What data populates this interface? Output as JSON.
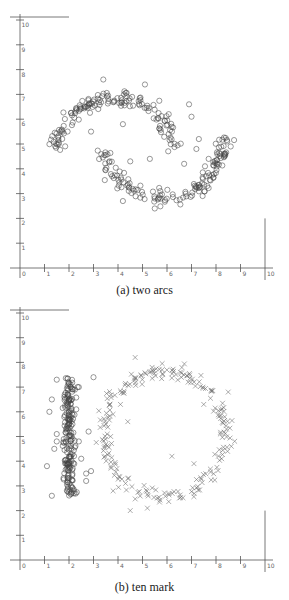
{
  "chart_data": [
    {
      "type": "scatter",
      "title": "",
      "caption": "(a) two arcs",
      "xlabel": "",
      "ylabel": "",
      "xlim": [
        0,
        10
      ],
      "ylim": [
        0,
        10
      ],
      "xticks": [
        "0",
        "1",
        "2",
        "3",
        "4",
        "5",
        "6",
        "7",
        "8",
        "9",
        "10"
      ],
      "yticks": [
        "1",
        "2",
        "3",
        "4",
        "5",
        "6",
        "7",
        "8",
        "9",
        "10"
      ],
      "grid": false,
      "legend": null,
      "series": [
        {
          "name": "upper arc",
          "marker": "circle",
          "shape": "arc",
          "center": [
            3.9,
            4.4
          ],
          "radius": 2.5,
          "angle_range_deg": [
            10,
            170
          ],
          "noise": 0.22,
          "count": 150
        },
        {
          "name": "lower arc",
          "marker": "circle",
          "shape": "arc",
          "center": [
            5.8,
            5.3
          ],
          "radius": 2.5,
          "angle_range_deg": [
            190,
            360
          ],
          "noise": 0.22,
          "count": 150
        },
        {
          "name": "outliers",
          "marker": "circle",
          "points": [
            [
              3.4,
              7.6
            ],
            [
              5.1,
              7.4
            ],
            [
              6.9,
              6.6
            ],
            [
              4.2,
              5.8
            ],
            [
              2.9,
              5.5
            ],
            [
              6.2,
              5.5
            ],
            [
              7.0,
              6.1
            ],
            [
              7.3,
              5.2
            ],
            [
              7.2,
              4.8
            ],
            [
              8.6,
              4.9
            ],
            [
              5.3,
              4.4
            ],
            [
              4.5,
              4.3
            ],
            [
              4.2,
              2.7
            ],
            [
              5.5,
              2.4
            ],
            [
              7.6,
              3.7
            ],
            [
              7.7,
              4.4
            ],
            [
              6.7,
              4.2
            ]
          ]
        }
      ]
    },
    {
      "type": "scatter",
      "title": "",
      "caption": "(b) ten mark",
      "xlabel": "",
      "ylabel": "",
      "xlim": [
        0,
        10
      ],
      "ylim": [
        0,
        10
      ],
      "xticks": [
        "0",
        "1",
        "2",
        "3",
        "4",
        "5",
        "6",
        "7",
        "8",
        "9",
        "10"
      ],
      "yticks": [
        "1",
        "2",
        "3",
        "4",
        "5",
        "6",
        "7",
        "8",
        "9",
        "10"
      ],
      "grid": false,
      "legend": null,
      "series": [
        {
          "name": "vertical bar (1)",
          "marker": "circle",
          "shape": "bar",
          "x_center": 2.0,
          "x_spread": 0.18,
          "y_range": [
            2.6,
            7.4
          ],
          "count": 200,
          "outliers": [
            [
              1.5,
              7.3
            ],
            [
              1.3,
              6.5
            ],
            [
              1.2,
              6.0
            ],
            [
              1.5,
              4.8
            ],
            [
              1.4,
              4.5
            ],
            [
              2.4,
              7.0
            ],
            [
              3.0,
              7.4
            ],
            [
              2.8,
              5.2
            ],
            [
              2.4,
              4.8
            ],
            [
              2.5,
              4.1
            ],
            [
              1.1,
              3.8
            ],
            [
              1.3,
              2.6
            ],
            [
              2.7,
              3.5
            ],
            [
              2.7,
              3.2
            ],
            [
              2.9,
              3.6
            ],
            [
              1.5,
              5.1
            ]
          ]
        },
        {
          "name": "ring (0)",
          "marker": "x",
          "shape": "ring",
          "center": [
            5.9,
            5.1
          ],
          "radius": 2.5,
          "noise": 0.15,
          "count": 220,
          "outliers": [
            [
              4.7,
              8.2
            ],
            [
              5.8,
              7.7
            ],
            [
              4.1,
              6.3
            ],
            [
              3.7,
              5.0
            ],
            [
              7.5,
              6.3
            ],
            [
              4.5,
              2.0
            ],
            [
              5.2,
              2.1
            ],
            [
              3.8,
              2.8
            ],
            [
              7.1,
              3.9
            ],
            [
              8.5,
              6.8
            ],
            [
              4.4,
              5.6
            ],
            [
              6.2,
              4.2
            ]
          ]
        }
      ]
    }
  ]
}
